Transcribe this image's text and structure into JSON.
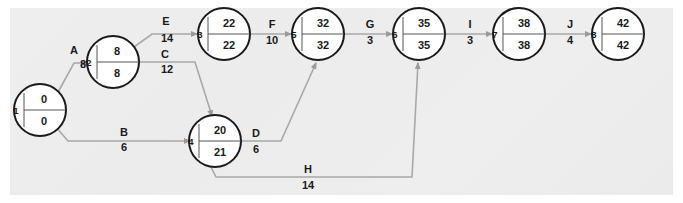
{
  "diagram": {
    "type": "cpm-network",
    "background_color": "#ededed",
    "node_fill": "#ffffff",
    "node_stroke": "#1a1a1a",
    "edge_color": "#a8a8a8",
    "nodes": [
      {
        "id": "1",
        "label": "1",
        "early": "0",
        "late": "0",
        "cx": 40,
        "cy": 110
      },
      {
        "id": "2",
        "label": "2",
        "early": "8",
        "late": "8",
        "cx": 113,
        "cy": 62
      },
      {
        "id": "3",
        "label": "3",
        "early": "22",
        "late": "22",
        "cx": 224,
        "cy": 34
      },
      {
        "id": "4",
        "label": "4",
        "early": "20",
        "late": "21",
        "cx": 215,
        "cy": 141
      },
      {
        "id": "5",
        "label": "5",
        "early": "32",
        "late": "32",
        "cx": 318,
        "cy": 34
      },
      {
        "id": "6",
        "label": "6",
        "early": "35",
        "late": "35",
        "cx": 419,
        "cy": 34
      },
      {
        "id": "7",
        "label": "7",
        "early": "38",
        "late": "38",
        "cx": 519,
        "cy": 34
      },
      {
        "id": "8",
        "label": "8",
        "early": "42",
        "late": "42",
        "cx": 618,
        "cy": 34
      }
    ],
    "edges": [
      {
        "id": "A",
        "label": "A",
        "duration": "8",
        "from": "1",
        "to": "2",
        "label_x": 74,
        "label_y": 51,
        "dur_x": 83,
        "dur_y": 65
      },
      {
        "id": "B",
        "label": "B",
        "duration": "6",
        "from": "1",
        "to": "4",
        "label_x": 124,
        "label_y": 133,
        "dur_x": 124,
        "dur_y": 148
      },
      {
        "id": "C",
        "label": "C",
        "duration": "12",
        "from": "2",
        "to": "4",
        "label_x": 165,
        "label_y": 55,
        "dur_x": 167,
        "dur_y": 70
      },
      {
        "id": "E",
        "label": "E",
        "duration": "14",
        "from": "2",
        "to": "3",
        "label_x": 166,
        "label_y": 22,
        "dur_x": 167,
        "dur_y": 39
      },
      {
        "id": "F",
        "label": "F",
        "duration": "10",
        "from": "3",
        "to": "5",
        "label_x": 272,
        "label_y": 25,
        "dur_x": 272,
        "dur_y": 41
      },
      {
        "id": "D",
        "label": "D",
        "duration": "6",
        "from": "4",
        "to": "5",
        "label_x": 256,
        "label_y": 134,
        "dur_x": 256,
        "dur_y": 150
      },
      {
        "id": "G",
        "label": "G",
        "duration": "3",
        "from": "5",
        "to": "6",
        "label_x": 370,
        "label_y": 25,
        "dur_x": 370,
        "dur_y": 41
      },
      {
        "id": "H",
        "label": "H",
        "duration": "14",
        "from": "4",
        "to": "6",
        "label_x": 308,
        "label_y": 170,
        "dur_x": 308,
        "dur_y": 186
      },
      {
        "id": "I",
        "label": "I",
        "duration": "3",
        "from": "6",
        "to": "7",
        "label_x": 470,
        "label_y": 25,
        "dur_x": 470,
        "dur_y": 41
      },
      {
        "id": "J",
        "label": "J",
        "duration": "4",
        "from": "7",
        "to": "8",
        "label_x": 570,
        "label_y": 25,
        "dur_x": 570,
        "dur_y": 41
      }
    ]
  }
}
